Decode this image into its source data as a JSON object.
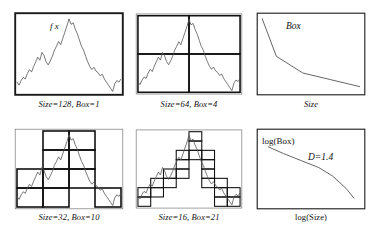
{
  "figure": {
    "background": "#ffffff",
    "ink": "#1a1a1a",
    "curve_color": "#555555"
  },
  "panels": [
    {
      "id": "panel-size-128",
      "caption": "Size=128, Box=1",
      "size_label": "Size=128",
      "box_label": "Box=1",
      "inner_label": "f x",
      "grid": 1,
      "boxes_filled": 1,
      "box_cells": [
        [
          0,
          0
        ]
      ]
    },
    {
      "id": "panel-size-64",
      "caption": "Size=64, Box=4",
      "size_label": "Size=64",
      "box_label": "Box=4",
      "inner_label": "",
      "grid": 2,
      "boxes_filled": 4,
      "box_cells": [
        [
          0,
          0
        ],
        [
          1,
          0
        ],
        [
          0,
          1
        ],
        [
          1,
          1
        ]
      ]
    },
    {
      "id": "panel-box-vs-size",
      "caption": "",
      "ylabel": "Box",
      "xlabel": "Size",
      "inner_label": ""
    },
    {
      "id": "panel-size-32",
      "caption": "Size=32, Box=10",
      "size_label": "Size=32",
      "box_label": "Box=10",
      "inner_label": "",
      "grid": 4,
      "boxes_filled": 10,
      "box_cells": [
        [
          0,
          2
        ],
        [
          0,
          3
        ],
        [
          1,
          0
        ],
        [
          1,
          1
        ],
        [
          1,
          2
        ],
        [
          1,
          3
        ],
        [
          2,
          0
        ],
        [
          2,
          1
        ],
        [
          2,
          2
        ],
        [
          3,
          3
        ]
      ]
    },
    {
      "id": "panel-size-16",
      "caption": "Size=16, Box=21",
      "size_label": "Size=16",
      "box_label": "Box=21",
      "inner_label": "",
      "grid": 8,
      "boxes_filled": 21,
      "box_cells": [
        [
          0,
          6
        ],
        [
          0,
          7
        ],
        [
          1,
          5
        ],
        [
          1,
          6
        ],
        [
          2,
          4
        ],
        [
          2,
          5
        ],
        [
          3,
          3
        ],
        [
          3,
          4
        ],
        [
          3,
          2
        ],
        [
          4,
          0
        ],
        [
          4,
          1
        ],
        [
          4,
          2
        ],
        [
          5,
          2
        ],
        [
          5,
          3
        ],
        [
          5,
          4
        ],
        [
          5,
          5
        ],
        [
          6,
          5
        ],
        [
          6,
          6
        ],
        [
          6,
          7
        ],
        [
          7,
          6
        ],
        [
          7,
          7
        ]
      ]
    },
    {
      "id": "panel-log-log",
      "caption": "",
      "ylabel": "log(Box)",
      "xlabel": "log(Size)",
      "annotation": "D=1.4"
    }
  ],
  "chart_data": [
    {
      "type": "line",
      "name": "signal-fx",
      "title": "f x",
      "xlabel": "",
      "ylabel": "",
      "xlim": [
        0,
        1
      ],
      "ylim": [
        0,
        1
      ],
      "grid": false,
      "legend": "none",
      "x": [
        0.0,
        0.02,
        0.04,
        0.06,
        0.08,
        0.1,
        0.12,
        0.14,
        0.16,
        0.18,
        0.2,
        0.22,
        0.24,
        0.26,
        0.28,
        0.3,
        0.32,
        0.34,
        0.36,
        0.38,
        0.4,
        0.42,
        0.44,
        0.46,
        0.48,
        0.5,
        0.52,
        0.54,
        0.56,
        0.58,
        0.6,
        0.62,
        0.64,
        0.66,
        0.68,
        0.7,
        0.72,
        0.74,
        0.76,
        0.78,
        0.8,
        0.82,
        0.84,
        0.86,
        0.88,
        0.9,
        0.92,
        0.94,
        0.96,
        0.98,
        1.0
      ],
      "y": [
        0.14,
        0.1,
        0.16,
        0.2,
        0.18,
        0.25,
        0.3,
        0.27,
        0.34,
        0.4,
        0.46,
        0.42,
        0.52,
        0.48,
        0.4,
        0.36,
        0.41,
        0.47,
        0.55,
        0.6,
        0.66,
        0.62,
        0.7,
        0.78,
        0.86,
        0.95,
        0.88,
        0.9,
        0.82,
        0.76,
        0.68,
        0.6,
        0.55,
        0.47,
        0.4,
        0.34,
        0.3,
        0.33,
        0.28,
        0.26,
        0.22,
        0.24,
        0.18,
        0.14,
        0.1,
        0.06,
        0.02,
        0.12,
        0.16,
        0.14,
        0.18
      ]
    },
    {
      "type": "line",
      "name": "box-vs-size",
      "title": "",
      "xlabel": "Size",
      "ylabel": "Box",
      "xlim": [
        0,
        1
      ],
      "ylim": [
        0,
        1
      ],
      "grid": false,
      "legend": "none",
      "x": [
        0.02,
        0.16,
        0.42,
        0.7,
        0.98
      ],
      "y": [
        0.97,
        0.47,
        0.25,
        0.16,
        0.07
      ]
    },
    {
      "type": "line",
      "name": "log-box-vs-log-size",
      "title": "",
      "xlabel": "log(Size)",
      "ylabel": "log(Box)",
      "xlim": [
        0,
        1
      ],
      "ylim": [
        0,
        1
      ],
      "grid": false,
      "legend": "none",
      "annotations": [
        {
          "text": "D=1.4",
          "x": 0.55,
          "y": 0.7
        }
      ],
      "x": [
        0.06,
        0.22,
        0.4,
        0.58,
        0.72,
        0.86,
        0.94
      ],
      "y": [
        0.82,
        0.72,
        0.62,
        0.52,
        0.4,
        0.22,
        0.08
      ]
    }
  ]
}
